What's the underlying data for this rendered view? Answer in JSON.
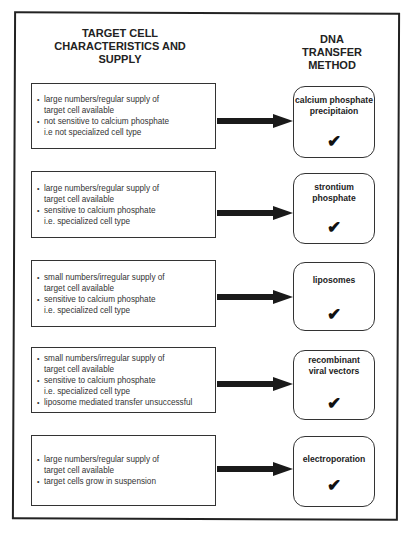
{
  "headers": {
    "left": "TARGET CELL CHARACTERISTICS AND SUPPLY",
    "left_lines": [
      "TARGET CELL",
      "CHARACTERISTICS AND",
      "SUPPLY"
    ],
    "right_lines": [
      "DNA",
      "TRANSFER",
      "METHOD"
    ]
  },
  "rows": [
    {
      "criteria": [
        {
          "line1": "large numbers/regular supply of",
          "line2": "target cell available"
        },
        {
          "line1": "not sensitive to calcium phosphate",
          "line2": "i.e not specialized cell type"
        }
      ],
      "method": "calcium phosphate precipitaion",
      "check": "✔"
    },
    {
      "criteria": [
        {
          "line1": "large numbers/regular supply of",
          "line2": "target cell available"
        },
        {
          "line1": "sensitive to calcium phosphate",
          "line2": "i.e. specialized cell type"
        }
      ],
      "method": "strontium phosphate",
      "check": "✔"
    },
    {
      "criteria": [
        {
          "line1": "small numbers/irregular supply of",
          "line2": "target cell available"
        },
        {
          "line1": "sensitive to calcium phosphate",
          "line2": "i.e. specialized cell type"
        }
      ],
      "method": "liposomes",
      "check": "✔"
    },
    {
      "criteria": [
        {
          "line1": "small numbers/irregular supply of",
          "line2": "target cell available"
        },
        {
          "line1": "sensitive to calcium phosphate",
          "line2": "i.e. specialized cell type"
        },
        {
          "line1": "liposome mediated transfer unsuccessful",
          "line2": ""
        }
      ],
      "method": "recombinant viral vectors",
      "check": "✔"
    },
    {
      "criteria": [
        {
          "line1": "large numbers/regular supply of",
          "line2": "target cell available"
        },
        {
          "line1": "target cells grow in suspension",
          "line2": ""
        }
      ],
      "method": "electroporation",
      "check": "✔"
    }
  ],
  "colors": {
    "line": "#222222",
    "text": "#333333",
    "background": "#ffffff"
  }
}
